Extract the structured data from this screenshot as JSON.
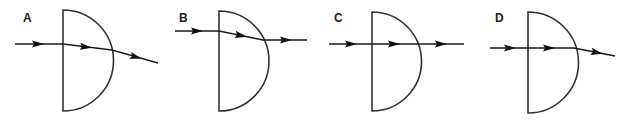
{
  "figure": {
    "ink_color": "#222222",
    "background": "#ffffff",
    "options": [
      {
        "label": "A",
        "label_pos": [
          23,
          22
        ],
        "lens": {
          "flat_x": 63,
          "top_y": 10,
          "bottom_y": 111,
          "radius": 50.5
        },
        "ray": [
          [
            15,
            44
          ],
          [
            63,
            44
          ],
          [
            112,
            50
          ],
          [
            158,
            63
          ]
        ],
        "arrows": [
          {
            "x": 38,
            "y": 44,
            "angle": 0
          },
          {
            "x": 86,
            "y": 47,
            "angle": 7
          },
          {
            "x": 136,
            "y": 57,
            "angle": 16
          }
        ],
        "behavior": "bends towards normal at flat face, bends away at curved face"
      },
      {
        "label": "B",
        "label_pos": [
          179,
          22
        ],
        "lens": {
          "flat_x": 219,
          "top_y": 11,
          "bottom_y": 111,
          "radius": 50
        },
        "ray": [
          [
            175,
            31
          ],
          [
            219,
            31
          ],
          [
            263,
            40
          ],
          [
            307,
            40
          ]
        ],
        "arrows": [
          {
            "x": 197,
            "y": 31,
            "angle": 0
          },
          {
            "x": 241,
            "y": 35.5,
            "angle": 11
          },
          {
            "x": 286,
            "y": 40,
            "angle": 0
          }
        ],
        "behavior": "bends at flat face, emerges parallel to incident ray"
      },
      {
        "label": "C",
        "label_pos": [
          334,
          22
        ],
        "lens": {
          "flat_x": 372,
          "top_y": 12,
          "bottom_y": 111,
          "radius": 49.5
        },
        "ray": [
          [
            329,
            44
          ],
          [
            372,
            44
          ],
          [
            418,
            44
          ],
          [
            464,
            44
          ]
        ],
        "arrows": [
          {
            "x": 351,
            "y": 44,
            "angle": 0
          },
          {
            "x": 394,
            "y": 44,
            "angle": 0
          },
          {
            "x": 441,
            "y": 44,
            "angle": 0
          }
        ],
        "behavior": "passes straight through undeviated"
      },
      {
        "label": "D",
        "label_pos": [
          495,
          22
        ],
        "lens": {
          "flat_x": 528,
          "top_y": 12,
          "bottom_y": 113,
          "radius": 50.5
        },
        "ray": [
          [
            490,
            48
          ],
          [
            528,
            48
          ],
          [
            574,
            48
          ],
          [
            615,
            56
          ]
        ],
        "arrows": [
          {
            "x": 510,
            "y": 48,
            "angle": 0
          },
          {
            "x": 549,
            "y": 48,
            "angle": 0
          },
          {
            "x": 597,
            "y": 52.5,
            "angle": 11
          }
        ],
        "behavior": "undeviated at flat face, bends away from normal at curved face"
      }
    ]
  }
}
